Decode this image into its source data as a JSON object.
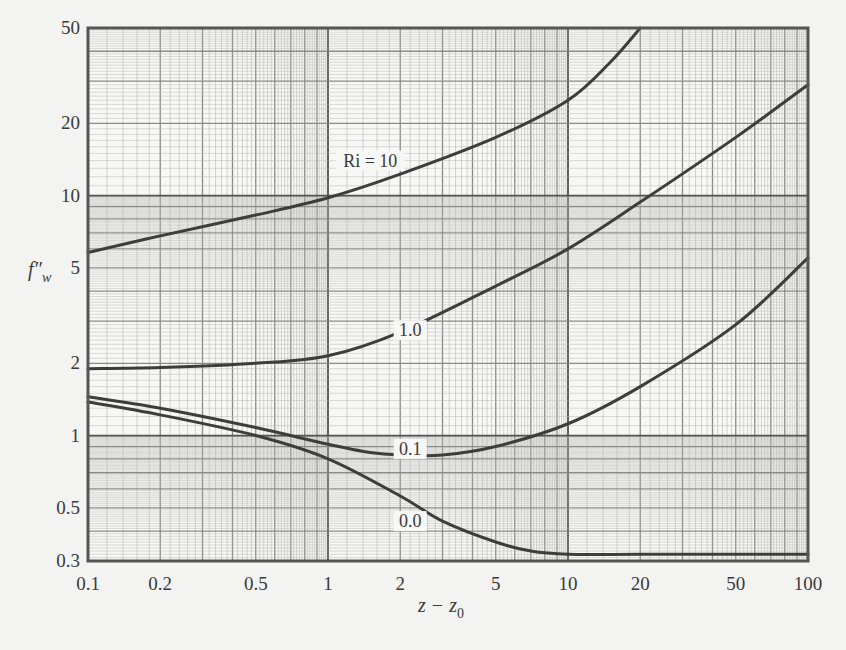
{
  "chart_data": {
    "type": "line",
    "title": "",
    "xlabel": "z − z0",
    "xlabel_main": "z − z",
    "xlabel_sub": "0",
    "ylabel": "f″w",
    "ylabel_main": "f″",
    "ylabel_sub": "w",
    "xscale": "log",
    "yscale": "log",
    "xlim": [
      0.1,
      100
    ],
    "ylim": [
      0.3,
      50
    ],
    "grid": true,
    "legend": "inline curve labels",
    "x_ticks": [
      0.1,
      0.2,
      0.5,
      1,
      2,
      5,
      10,
      20,
      50,
      100
    ],
    "x_tick_labels": [
      "0.1",
      "0.2",
      "0.5",
      "1",
      "2",
      "5",
      "10",
      "20",
      "50",
      "100"
    ],
    "y_ticks": [
      0.3,
      0.5,
      1,
      2,
      5,
      10,
      20,
      50
    ],
    "y_tick_labels": [
      "0.3",
      "0.5",
      "1",
      "2",
      "5",
      "10",
      "20",
      "50"
    ],
    "series": [
      {
        "name": "Ri = 10",
        "label": "Ri = 10",
        "label_at": [
          1.5,
          14
        ],
        "x": [
          0.1,
          0.2,
          0.5,
          1,
          2,
          5,
          10,
          15,
          20
        ],
        "y": [
          5.8,
          6.8,
          8.3,
          9.8,
          12.3,
          17.5,
          25,
          36,
          50
        ]
      },
      {
        "name": "Ri = 1.0",
        "label": "1.0",
        "label_at": [
          2.2,
          2.75
        ],
        "x": [
          0.1,
          0.2,
          0.5,
          1,
          2,
          5,
          10,
          20,
          50,
          100
        ],
        "y": [
          1.9,
          1.92,
          2.0,
          2.15,
          2.7,
          4.2,
          6.0,
          9.4,
          17.5,
          29
        ]
      },
      {
        "name": "Ri = 0.1",
        "label": "0.1",
        "label_at": [
          2.2,
          0.88
        ],
        "x": [
          0.1,
          0.2,
          0.5,
          1,
          1.5,
          2,
          3,
          5,
          10,
          20,
          50,
          100
        ],
        "y": [
          1.45,
          1.3,
          1.08,
          0.92,
          0.85,
          0.83,
          0.83,
          0.9,
          1.12,
          1.6,
          2.9,
          5.5
        ]
      },
      {
        "name": "Ri = 0.0",
        "label": "0.0",
        "label_at": [
          2.2,
          0.44
        ],
        "x": [
          0.1,
          0.2,
          0.5,
          1,
          2,
          3,
          5,
          7,
          10,
          20,
          50,
          100
        ],
        "y": [
          1.38,
          1.22,
          1.0,
          0.8,
          0.56,
          0.44,
          0.36,
          0.33,
          0.32,
          0.32,
          0.32,
          0.32
        ]
      }
    ]
  },
  "colors": {
    "background": "#f3f3f1",
    "paper": "#f7f7f5",
    "grid_minor": "#b9b9b9",
    "grid_mid": "#8a8a8a",
    "grid_major": "#555555",
    "curve": "#3d3d3d",
    "text": "#3a3a3a"
  }
}
